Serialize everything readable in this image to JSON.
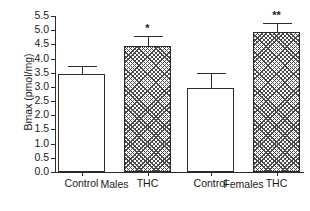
{
  "chart_data": {
    "type": "bar",
    "title": "",
    "xlabel": "",
    "ylabel": "Bmax (pmol/mg)",
    "ylim": [
      0.0,
      5.5
    ],
    "ytick_step": 0.5,
    "yticks": [
      "5.5",
      "5.0",
      "4.5",
      "4.0",
      "3.5",
      "3.0",
      "2.5",
      "2.0",
      "1.5",
      "1.0",
      "0.5",
      "0.0"
    ],
    "grid": false,
    "legend": "none",
    "groups": [
      {
        "name": "Males",
        "label": "Males"
      },
      {
        "name": "Females",
        "label": "Females"
      }
    ],
    "categories": [
      "Control",
      "THC",
      "Control",
      "THC"
    ],
    "bars": [
      {
        "group": "Males",
        "category": "Control",
        "value": 3.45,
        "error": 0.3,
        "fill": "open",
        "significance": ""
      },
      {
        "group": "Males",
        "category": "THC",
        "value": 4.45,
        "error": 0.35,
        "fill": "hatched",
        "significance": "*"
      },
      {
        "group": "Females",
        "category": "Control",
        "value": 2.95,
        "error": 0.55,
        "fill": "open",
        "significance": ""
      },
      {
        "group": "Females",
        "category": "THC",
        "value": 4.95,
        "error": 0.3,
        "fill": "hatched",
        "significance": "**"
      }
    ],
    "colors": {
      "axis": "#2b2b2b",
      "bar_edge": "#2b2b2b",
      "bar_open_fill": "#ffffff",
      "hatch": "#4a4a4a",
      "text": "#1a1a1a",
      "background": "#ffffff"
    }
  }
}
